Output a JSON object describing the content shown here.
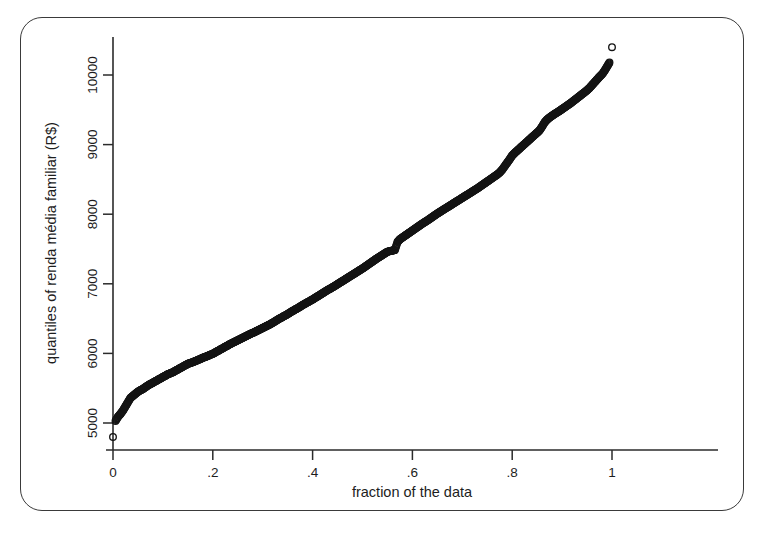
{
  "figure": {
    "frame_color": "#3a3a3a",
    "background": "#ffffff",
    "marker_color": "#141414",
    "axis_color": "#2b2b2b"
  },
  "chart_data": {
    "type": "scatter",
    "title": "",
    "subtitle": "",
    "xlabel": "fraction of the data",
    "ylabel": "quantiles of renda média familiar (R$)",
    "xlim": [
      -0.012,
      1.035
    ],
    "ylim": [
      4620,
      10520
    ],
    "xticks": [
      0,
      0.2,
      0.4,
      0.6,
      0.8,
      1
    ],
    "xticklabels": [
      "0",
      ".2",
      ".4",
      ".6",
      ".8",
      "1"
    ],
    "yticks": [
      5000,
      6000,
      7000,
      8000,
      9000,
      10000
    ],
    "yticklabels": [
      "5000",
      "6000",
      "7000",
      "8000",
      "9000",
      "10000"
    ],
    "grid": false,
    "legend": null,
    "marker": "open-circle",
    "marker_size": 4.6,
    "series": [
      {
        "name": "quantiles of renda média familiar (R$)",
        "x": [
          0.0,
          0.005,
          0.01,
          0.015,
          0.02,
          0.025,
          0.03,
          0.035,
          0.04,
          0.045,
          0.05,
          0.055,
          0.06,
          0.065,
          0.07,
          0.075,
          0.08,
          0.085,
          0.09,
          0.095,
          0.1,
          0.105,
          0.11,
          0.115,
          0.12,
          0.125,
          0.13,
          0.135,
          0.14,
          0.145,
          0.15,
          0.155,
          0.16,
          0.165,
          0.17,
          0.175,
          0.18,
          0.185,
          0.19,
          0.195,
          0.2,
          0.205,
          0.21,
          0.215,
          0.22,
          0.225,
          0.23,
          0.235,
          0.24,
          0.245,
          0.25,
          0.255,
          0.26,
          0.265,
          0.27,
          0.275,
          0.28,
          0.285,
          0.29,
          0.295,
          0.3,
          0.305,
          0.31,
          0.315,
          0.32,
          0.325,
          0.33,
          0.335,
          0.34,
          0.345,
          0.35,
          0.355,
          0.36,
          0.365,
          0.37,
          0.375,
          0.38,
          0.385,
          0.39,
          0.395,
          0.4,
          0.405,
          0.41,
          0.415,
          0.42,
          0.425,
          0.43,
          0.435,
          0.44,
          0.445,
          0.45,
          0.455,
          0.46,
          0.465,
          0.47,
          0.475,
          0.48,
          0.485,
          0.49,
          0.495,
          0.5,
          0.505,
          0.51,
          0.515,
          0.52,
          0.525,
          0.53,
          0.535,
          0.54,
          0.545,
          0.55,
          0.555,
          0.56,
          0.565,
          0.57,
          0.575,
          0.58,
          0.585,
          0.59,
          0.595,
          0.6,
          0.605,
          0.61,
          0.615,
          0.62,
          0.625,
          0.63,
          0.635,
          0.64,
          0.645,
          0.65,
          0.655,
          0.66,
          0.665,
          0.67,
          0.675,
          0.68,
          0.685,
          0.69,
          0.695,
          0.7,
          0.705,
          0.71,
          0.715,
          0.72,
          0.725,
          0.73,
          0.735,
          0.74,
          0.745,
          0.75,
          0.755,
          0.76,
          0.765,
          0.77,
          0.775,
          0.78,
          0.785,
          0.79,
          0.795,
          0.8,
          0.805,
          0.81,
          0.815,
          0.82,
          0.825,
          0.83,
          0.835,
          0.84,
          0.845,
          0.85,
          0.855,
          0.86,
          0.865,
          0.87,
          0.875,
          0.88,
          0.885,
          0.89,
          0.895,
          0.9,
          0.905,
          0.91,
          0.915,
          0.92,
          0.925,
          0.93,
          0.935,
          0.94,
          0.945,
          0.95,
          0.955,
          0.96,
          0.965,
          0.97,
          0.975,
          0.98,
          0.985,
          0.99,
          0.995,
          1.0
        ],
        "y": [
          4800,
          5030,
          5090,
          5130,
          5180,
          5240,
          5300,
          5360,
          5390,
          5420,
          5450,
          5470,
          5490,
          5515,
          5540,
          5560,
          5580,
          5600,
          5620,
          5640,
          5660,
          5680,
          5700,
          5715,
          5730,
          5750,
          5770,
          5790,
          5810,
          5830,
          5850,
          5862,
          5875,
          5890,
          5905,
          5920,
          5938,
          5950,
          5965,
          5980,
          5995,
          6015,
          6035,
          6055,
          6075,
          6095,
          6115,
          6135,
          6155,
          6172,
          6190,
          6208,
          6225,
          6243,
          6260,
          6278,
          6295,
          6312,
          6330,
          6348,
          6365,
          6382,
          6400,
          6420,
          6440,
          6462,
          6485,
          6505,
          6525,
          6545,
          6565,
          6588,
          6610,
          6630,
          6650,
          6672,
          6695,
          6715,
          6735,
          6755,
          6775,
          6798,
          6820,
          6842,
          6865,
          6888,
          6910,
          6930,
          6950,
          6972,
          6995,
          7018,
          7040,
          7062,
          7085,
          7108,
          7130,
          7152,
          7175,
          7198,
          7220,
          7245,
          7270,
          7295,
          7320,
          7345,
          7370,
          7392,
          7415,
          7438,
          7460,
          7470,
          7478,
          7485,
          7600,
          7640,
          7665,
          7690,
          7715,
          7740,
          7765,
          7790,
          7815,
          7840,
          7865,
          7888,
          7910,
          7935,
          7960,
          7985,
          8010,
          8032,
          8055,
          8078,
          8100,
          8122,
          8145,
          8168,
          8190,
          8212,
          8235,
          8258,
          8280,
          8302,
          8325,
          8348,
          8370,
          8395,
          8420,
          8445,
          8470,
          8495,
          8520,
          8545,
          8570,
          8600,
          8640,
          8690,
          8740,
          8790,
          8845,
          8880,
          8912,
          8945,
          8978,
          9010,
          9042,
          9075,
          9108,
          9140,
          9172,
          9205,
          9260,
          9320,
          9360,
          9390,
          9415,
          9440,
          9462,
          9485,
          9510,
          9535,
          9560,
          9585,
          9612,
          9640,
          9668,
          9696,
          9724,
          9752,
          9780,
          9815,
          9855,
          9895,
          9935,
          9975,
          10010,
          10060,
          10120,
          10180,
          10400
        ]
      }
    ]
  }
}
